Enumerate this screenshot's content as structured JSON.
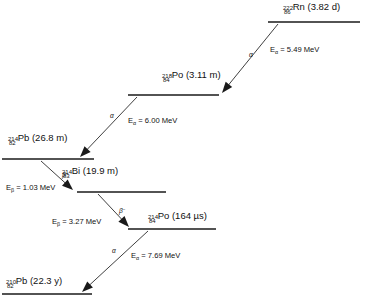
{
  "diagram": {
    "type": "decay-chain",
    "colors": {
      "background": "#ffffff",
      "level_line": "#1a1a1a",
      "arrow": "#2a2a2a",
      "text": "#111111"
    }
  },
  "levels": [
    {
      "id": "rn222",
      "mass_number": "222",
      "atomic_number": "86",
      "element": "Rn",
      "half_life": "(3.82 d)",
      "label_x": 283,
      "label_y": 14,
      "line_x1": 268,
      "line_x2": 360,
      "line_y": 22
    },
    {
      "id": "po218",
      "mass_number": "218",
      "atomic_number": "84",
      "element": "Po",
      "half_life": "(3.11 m)",
      "label_x": 162,
      "label_y": 82,
      "line_x1": 128,
      "line_x2": 219,
      "line_y": 95
    },
    {
      "id": "pb214",
      "mass_number": "214",
      "atomic_number": "82",
      "element": "Pb",
      "half_life": "(26.8 m)",
      "label_x": 8,
      "label_y": 145,
      "line_x1": 2,
      "line_x2": 94,
      "line_y": 159
    },
    {
      "id": "bi214",
      "mass_number": "214",
      "atomic_number": "83",
      "element": "Bi",
      "half_life": "(19.9 m)",
      "label_x": 62,
      "label_y": 178,
      "line_x1": 77,
      "line_x2": 166,
      "line_y": 192
    },
    {
      "id": "po214",
      "mass_number": "214",
      "atomic_number": "84",
      "element": "Po",
      "half_life": "(164 µs)",
      "label_x": 148,
      "label_y": 223,
      "line_x1": 128,
      "line_x2": 216,
      "line_y": 229
    },
    {
      "id": "pb210",
      "mass_number": "210",
      "atomic_number": "82",
      "element": "Pb",
      "half_life": "(22.3 y)",
      "label_x": 6,
      "label_y": 288,
      "line_x1": 2,
      "line_x2": 92,
      "line_y": 294
    }
  ],
  "transitions": [
    {
      "id": "rn222-to-po218",
      "mode": "α",
      "mode_sup": "",
      "mode_x": 249,
      "mode_y": 57,
      "energy_label": "E",
      "energy_sub": "α",
      "energy_value": " = 5.49 MeV",
      "energy_x": 270,
      "energy_y": 52,
      "x1": 278,
      "y1": 24,
      "x2": 222,
      "y2": 93
    },
    {
      "id": "po218-to-pb214",
      "mode": "α",
      "mode_sup": "",
      "mode_x": 110,
      "mode_y": 118,
      "energy_label": "E",
      "energy_sub": "α",
      "energy_value": " = 6.00 MeV",
      "energy_x": 128,
      "energy_y": 123,
      "x1": 137,
      "y1": 97,
      "x2": 80,
      "y2": 157
    },
    {
      "id": "pb214-to-bi214",
      "mode": "β",
      "mode_sup": "−",
      "mode_x": 62,
      "mode_y": 177,
      "energy_label": "E",
      "energy_sub": "β",
      "energy_value": " = 1.03 MeV",
      "energy_x": 6,
      "energy_y": 190,
      "x1": 41,
      "y1": 161,
      "x2": 73,
      "y2": 190
    },
    {
      "id": "bi214-to-po214",
      "mode": "β",
      "mode_sup": "−",
      "mode_x": 119,
      "mode_y": 213,
      "energy_label": "E",
      "energy_sub": "β",
      "energy_value": " = 3.27 MeV",
      "energy_x": 52,
      "energy_y": 224,
      "x1": 98,
      "y1": 194,
      "x2": 129,
      "y2": 227
    },
    {
      "id": "po214-to-pb210",
      "mode": "α",
      "mode_sup": "",
      "mode_x": 112,
      "mode_y": 253,
      "energy_label": "E",
      "energy_sub": "α",
      "energy_value": " = 7.69 MeV",
      "energy_x": 131,
      "energy_y": 258,
      "x1": 148,
      "y1": 231,
      "x2": 82,
      "y2": 292
    }
  ]
}
